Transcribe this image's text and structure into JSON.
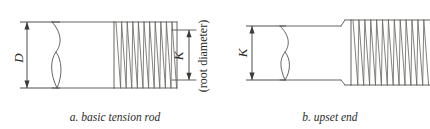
{
  "figure": {
    "background_color": "#ffffff",
    "line_color": "#55544f",
    "text_color": "#2b2b28",
    "width": 430,
    "height": 129,
    "panels": [
      {
        "id": "panel-a",
        "caption": "a. basic tension rod",
        "caption_x": 115,
        "caption_y": 120,
        "dimensions": [
          {
            "name": "D",
            "label": "D",
            "meaning": "rod shank diameter",
            "orientation": "vertical",
            "side": "left",
            "x": 27,
            "y_top": 22,
            "y_bottom": 88,
            "label_x": 23,
            "label_y": 58
          },
          {
            "name": "K",
            "label": "K",
            "meaning": "root diameter",
            "annotation": "(root diameter)",
            "orientation": "vertical",
            "side": "right",
            "x": 189,
            "y_top": 30,
            "y_bottom": 80,
            "label_x": 184,
            "label_y": 57,
            "annotation_x": 208,
            "annotation_y": 57
          }
        ],
        "features": [
          "break-line-left",
          "plain-shank",
          "threaded-section-right",
          "flat-end-face"
        ],
        "thread_count": 11
      },
      {
        "id": "panel-b",
        "caption": "b. upset end",
        "caption_x": 330,
        "caption_y": 120,
        "dimensions": [
          {
            "name": "K",
            "label": "K",
            "meaning": "rod diameter",
            "orientation": "vertical",
            "side": "left",
            "x": 252,
            "y_top": 26,
            "y_bottom": 80,
            "label_x": 247,
            "label_y": 54
          }
        ],
        "features": [
          "break-line-left",
          "plain-shank",
          "upset-shoulder",
          "enlarged-threaded-section",
          "threads-run-off-right-edge"
        ],
        "thread_count": 11
      }
    ]
  }
}
